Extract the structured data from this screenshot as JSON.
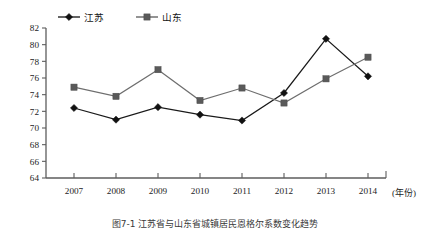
{
  "chart_data": {
    "type": "line",
    "title": "",
    "subtitle": "",
    "xlabel": "(年份)",
    "ylabel": "",
    "categories": [
      "2007",
      "2008",
      "2009",
      "2010",
      "2011",
      "2012",
      "2013",
      "2014"
    ],
    "series": [
      {
        "name": "江苏",
        "marker": "diamond",
        "color": "#111111",
        "values": [
          72.4,
          71.0,
          72.5,
          71.6,
          70.9,
          74.2,
          80.7,
          76.2
        ]
      },
      {
        "name": "山东",
        "marker": "square",
        "color": "#5a5a5a",
        "values": [
          74.9,
          73.8,
          77.0,
          73.3,
          74.8,
          73.0,
          75.9,
          78.5
        ]
      }
    ],
    "ylim": [
      64,
      82
    ],
    "ytick_step": 2,
    "yticks": [
      64,
      66,
      68,
      70,
      72,
      74,
      76,
      78,
      80,
      82
    ],
    "grid": false,
    "legend_position": "top-left"
  },
  "legend": {
    "items": [
      {
        "label": "江苏",
        "marker": "diamond"
      },
      {
        "label": "山东",
        "marker": "square"
      }
    ]
  },
  "axes": {
    "x_unit_label": "(年份)",
    "y_unit_label": ""
  },
  "caption": {
    "text": "图7-1  江苏省与山东省城镇居民恩格尔系数变化趋势"
  }
}
